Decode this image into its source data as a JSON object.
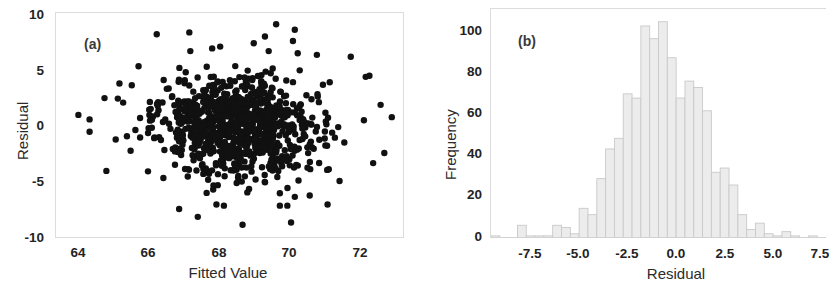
{
  "figure": {
    "background": "#ffffff",
    "panels": [
      {
        "tag": "(a)",
        "type": "scatter"
      },
      {
        "tag": "(b)",
        "type": "histogram"
      }
    ]
  },
  "panel_a": {
    "tag": "(a)",
    "xlabel": "Fitted Value",
    "ylabel": "Residual",
    "xticks": [
      "64",
      "66",
      "68",
      "70",
      "72"
    ],
    "yticks": [
      "10",
      "5",
      "0",
      "-5",
      "-10"
    ]
  },
  "panel_b": {
    "tag": "(b)",
    "xlabel": "Residual",
    "ylabel": "Frequency",
    "xticks": [
      "-7.5",
      "-5.0",
      "-2.5",
      "0.0",
      "2.5",
      "5.0",
      "7.5"
    ],
    "yticks": [
      "100",
      "80",
      "60",
      "40",
      "20",
      "0"
    ]
  },
  "chart_data": [
    {
      "type": "scatter",
      "title": "",
      "panel": "(a)",
      "xlabel": "Fitted Value",
      "ylabel": "Residual",
      "xlim": [
        63.6,
        72.9
      ],
      "ylim": [
        -10,
        10
      ],
      "xticks": [
        64,
        66,
        68,
        70,
        72
      ],
      "yticks": [
        -10,
        -5,
        0,
        5,
        10
      ],
      "grid": false,
      "marker_color": "#111111",
      "marker_size": 3.2,
      "n_points": 1000,
      "description": "Residuals versus fitted values; dense centered cloud, roughly constant variance, mean near 0, bulk between -5 and 5, fitted values concentrated 66.5-70.5.",
      "generator": {
        "method": "gaussian-cloud",
        "x_mean": 68.45,
        "x_sd": 1.05,
        "y_mean": 0.0,
        "y_sd": 2.25,
        "seed": 20240517
      },
      "outliers": [
        [
          66.3,
          8.1
        ],
        [
          69.5,
          9.0
        ],
        [
          70.0,
          8.5
        ],
        [
          69.2,
          7.9
        ],
        [
          69.95,
          7.5
        ],
        [
          67.2,
          6.6
        ],
        [
          68.0,
          7.0
        ],
        [
          69.3,
          6.6
        ],
        [
          71.5,
          6.1
        ],
        [
          68.9,
          7.3
        ],
        [
          66.9,
          -7.5
        ],
        [
          67.4,
          -8.2
        ],
        [
          68.6,
          -8.9
        ],
        [
          69.9,
          -8.7
        ],
        [
          67.9,
          -7.1
        ],
        [
          68.1,
          -7.2
        ],
        [
          69.6,
          -7.2
        ],
        [
          69.8,
          -7.2
        ],
        [
          64.2,
          0.9
        ],
        [
          64.5,
          0.5
        ],
        [
          64.5,
          -0.6
        ],
        [
          64.9,
          2.4
        ],
        [
          64.95,
          -4.1
        ],
        [
          72.3,
          1.8
        ],
        [
          72.6,
          0.7
        ],
        [
          72.4,
          -2.5
        ],
        [
          72.1,
          -3.4
        ],
        [
          65.3,
          3.7
        ],
        [
          65.4,
          2.0
        ],
        [
          65.2,
          -1.3
        ],
        [
          65.6,
          -2.3
        ],
        [
          71.9,
          4.3
        ],
        [
          72.0,
          4.4
        ],
        [
          71.2,
          -5.0
        ],
        [
          70.4,
          -6.3
        ],
        [
          69.6,
          -6.1
        ]
      ]
    },
    {
      "type": "bar",
      "panel": "(b)",
      "subtype": "histogram",
      "title": "",
      "xlabel": "Residual",
      "ylabel": "Frequency",
      "xlim": [
        -9.5,
        9.5
      ],
      "ylim": [
        0,
        108
      ],
      "xticks": [
        -7.5,
        -5.0,
        -2.5,
        0.0,
        2.5,
        5.0,
        7.5
      ],
      "yticks": [
        0,
        20,
        40,
        60,
        80,
        100
      ],
      "grid": false,
      "bar_fill": "#ececec",
      "bar_edge": "#c9c9c9",
      "bin_width": 0.5,
      "bin_centers": [
        -9.25,
        -8.75,
        -8.25,
        -7.75,
        -7.25,
        -6.75,
        -6.25,
        -5.75,
        -5.25,
        -4.75,
        -4.25,
        -3.75,
        -3.25,
        -2.75,
        -2.25,
        -1.75,
        -1.25,
        -0.75,
        -0.25,
        0.25,
        0.75,
        1.25,
        1.75,
        2.25,
        2.75,
        3.25,
        3.75,
        4.25,
        4.75,
        5.25,
        5.75,
        6.25,
        6.75,
        7.25,
        7.75,
        8.25,
        8.75
      ],
      "values": [
        1,
        0,
        0,
        6,
        1,
        1,
        1,
        6,
        5,
        2,
        14,
        11,
        28,
        42,
        47,
        68,
        66,
        100,
        94,
        102,
        85,
        66,
        74,
        71,
        60,
        31,
        33,
        25,
        11,
        4,
        7,
        2,
        1,
        3,
        1,
        0,
        1
      ]
    }
  ]
}
